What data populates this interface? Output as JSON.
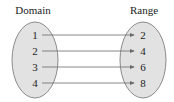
{
  "diagram": {
    "domain_label": "Domain",
    "range_label": "Range",
    "domain_values": [
      "1",
      "2",
      "3",
      "4"
    ],
    "range_values": [
      "2",
      "4",
      "6",
      "8"
    ],
    "mappings": [
      [
        "1",
        "2"
      ],
      [
        "2",
        "4"
      ],
      [
        "3",
        "6"
      ],
      [
        "4",
        "8"
      ]
    ],
    "colors": {
      "ellipse_fill": "#e2e2e2",
      "ellipse_stroke": "#8a8a8a",
      "arrow": "#6a6a6a",
      "text": "#222222"
    }
  }
}
